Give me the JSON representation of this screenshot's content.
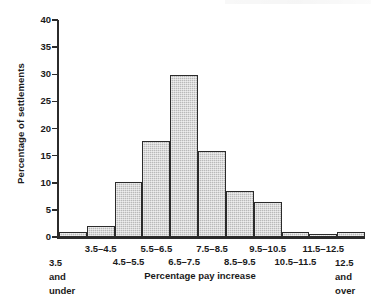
{
  "chart_data": {
    "type": "bar",
    "title": "",
    "subtitle": "",
    "xlabel": "Percentage pay increase",
    "ylabel": "Percentage of settlements",
    "categories": [
      "3.5 and under",
      "3.5–4.5",
      "4.5–5.5",
      "5.5–6.5",
      "6.5–7.5",
      "7.5–8.5",
      "8.5–9.5",
      "9.5–10.5",
      "10.5–11.5",
      "11.5–12.5",
      "12.5 and over"
    ],
    "values": [
      1.0,
      2.0,
      10.2,
      17.7,
      29.8,
      15.8,
      8.4,
      6.4,
      1.0,
      0.3,
      1.0
    ],
    "ylim": [
      0,
      40
    ],
    "yticks": [
      0,
      5,
      10,
      15,
      20,
      25,
      30,
      35,
      40
    ],
    "ytick_labels": [
      "0",
      "5",
      "10",
      "15",
      "20",
      "25",
      "30",
      "35",
      "40"
    ],
    "grid": false,
    "legend": false,
    "bar_fill_color": "#b9b9b9",
    "bar_edge_color": "#2b2b2b",
    "axis_color": "#2b2b2b"
  },
  "axis_labels": {
    "x_row0": [
      {
        "text": "3.5–4.5",
        "bin": 1
      },
      {
        "text": "5.5–6.5",
        "bin": 3
      },
      {
        "text": "7.5–8.5",
        "bin": 5
      },
      {
        "text": "9.5–10.5",
        "bin": 7
      },
      {
        "text": "11.5–12.5",
        "bin": 9
      }
    ],
    "x_row1": [
      {
        "text": "4.5–5.5",
        "bin": 2
      },
      {
        "text": "6.5–7.5",
        "bin": 4
      },
      {
        "text": "8.5–9.5",
        "bin": 6
      },
      {
        "text": "10.5–11.5",
        "bin": 8
      }
    ],
    "x_first_stack": [
      "3.5",
      "and",
      "under"
    ],
    "x_last_stack": [
      "12.5",
      "and",
      "over"
    ]
  }
}
